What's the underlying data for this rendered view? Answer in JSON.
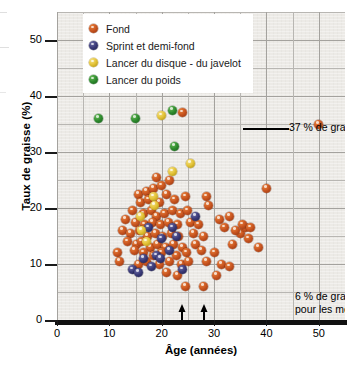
{
  "chart_data": {
    "type": "scatter",
    "title": "",
    "xlabel": "Âge (années)",
    "ylabel": "Taux de graisse (%)",
    "xlim": [
      0,
      55
    ],
    "ylim": [
      0,
      55
    ],
    "xticks": [
      0,
      10,
      20,
      30,
      40,
      50
    ],
    "yticks": [
      0,
      10,
      20,
      30,
      40,
      50
    ],
    "grid": true,
    "grid_step": 5,
    "legend_position": "top-center",
    "series": [
      {
        "name": "Fond",
        "color": "#c8541f",
        "key": "fond",
        "points": [
          [
            24.0,
            37.0
          ],
          [
            50.0,
            35.0
          ],
          [
            40.0,
            23.5
          ],
          [
            19.0,
            25.5
          ],
          [
            21.5,
            25.0
          ],
          [
            24.5,
            22.0
          ],
          [
            15.5,
            22.5
          ],
          [
            17.0,
            23.0
          ],
          [
            18.5,
            23.5
          ],
          [
            20.0,
            24.0
          ],
          [
            16.0,
            21.0
          ],
          [
            17.5,
            21.5
          ],
          [
            19.5,
            21.0
          ],
          [
            21.0,
            22.5
          ],
          [
            22.5,
            21.5
          ],
          [
            14.5,
            19.5
          ],
          [
            16.5,
            19.0
          ],
          [
            18.0,
            19.5
          ],
          [
            19.0,
            18.5
          ],
          [
            20.5,
            19.0
          ],
          [
            22.0,
            19.5
          ],
          [
            23.5,
            19.0
          ],
          [
            25.0,
            19.5
          ],
          [
            13.0,
            18.0
          ],
          [
            15.0,
            17.5
          ],
          [
            16.8,
            17.0
          ],
          [
            18.2,
            17.5
          ],
          [
            19.8,
            17.0
          ],
          [
            21.2,
            17.5
          ],
          [
            23.0,
            17.0
          ],
          [
            25.5,
            17.5
          ],
          [
            27.0,
            17.0
          ],
          [
            12.5,
            16.0
          ],
          [
            14.0,
            15.5
          ],
          [
            15.8,
            16.0
          ],
          [
            17.2,
            15.0
          ],
          [
            18.8,
            15.5
          ],
          [
            20.2,
            15.0
          ],
          [
            21.8,
            15.5
          ],
          [
            23.2,
            15.0
          ],
          [
            26.0,
            15.5
          ],
          [
            28.0,
            15.0
          ],
          [
            13.5,
            14.0
          ],
          [
            15.2,
            13.5
          ],
          [
            16.2,
            14.0
          ],
          [
            17.8,
            13.0
          ],
          [
            19.2,
            13.5
          ],
          [
            20.8,
            13.0
          ],
          [
            22.2,
            13.5
          ],
          [
            24.0,
            13.0
          ],
          [
            26.5,
            13.5
          ],
          [
            11.5,
            12.0
          ],
          [
            14.8,
            12.5
          ],
          [
            16.5,
            12.0
          ],
          [
            18.5,
            11.5
          ],
          [
            20.0,
            12.0
          ],
          [
            22.8,
            11.5
          ],
          [
            24.8,
            12.0
          ],
          [
            27.5,
            12.5
          ],
          [
            30.0,
            12.0
          ],
          [
            12.0,
            10.5
          ],
          [
            15.5,
            10.0
          ],
          [
            17.0,
            10.5
          ],
          [
            19.5,
            10.0
          ],
          [
            21.5,
            10.5
          ],
          [
            23.8,
            10.0
          ],
          [
            25.2,
            10.5
          ],
          [
            28.5,
            10.5
          ],
          [
            31.5,
            10.0
          ],
          [
            33.5,
            13.5
          ],
          [
            35.0,
            15.5
          ],
          [
            36.5,
            14.5
          ],
          [
            36.0,
            16.5
          ],
          [
            34.0,
            16.0
          ],
          [
            32.0,
            16.5
          ],
          [
            33.0,
            18.5
          ],
          [
            35.5,
            17.0
          ],
          [
            37.0,
            16.5
          ],
          [
            38.5,
            13.0
          ],
          [
            21.0,
            8.5
          ],
          [
            23.0,
            8.0
          ],
          [
            30.5,
            8.0
          ],
          [
            33.0,
            9.5
          ],
          [
            24.5,
            6.0
          ],
          [
            28.0,
            6.0
          ],
          [
            29.0,
            20.5
          ],
          [
            31.0,
            18.0
          ],
          [
            28.5,
            22.0
          ]
        ]
      },
      {
        "name": "Sprint et demi-fond",
        "color": "#3a3a78",
        "key": "sprint",
        "points": [
          [
            26.5,
            18.5
          ],
          [
            22.0,
            16.5
          ],
          [
            22.8,
            15.0
          ],
          [
            20.0,
            14.5
          ],
          [
            19.0,
            11.5
          ],
          [
            19.8,
            11.0
          ],
          [
            24.0,
            9.0
          ],
          [
            14.5,
            9.0
          ],
          [
            15.5,
            8.5
          ],
          [
            16.5,
            11.0
          ],
          [
            18.0,
            9.5
          ],
          [
            21.5,
            12.5
          ],
          [
            17.5,
            16.5
          ]
        ]
      },
      {
        "name": "Lancer du disque - du javelot",
        "color": "#e3c235",
        "key": "lancer-disque",
        "points": [
          [
            20.0,
            36.5
          ],
          [
            25.5,
            28.0
          ],
          [
            22.0,
            26.5
          ],
          [
            16.0,
            18.5
          ],
          [
            16.2,
            16.0
          ],
          [
            17.0,
            14.0
          ],
          [
            18.5,
            22.0
          ],
          [
            18.6,
            20.5
          ]
        ]
      },
      {
        "name": "Lancer du poids",
        "color": "#2e8b2e",
        "key": "lancer-poids",
        "points": [
          [
            8.0,
            36.0
          ],
          [
            15.0,
            36.0
          ],
          [
            22.0,
            37.5
          ],
          [
            22.5,
            31.0
          ]
        ]
      }
    ],
    "annotations": [
      {
        "id": "anno-37",
        "text": "37 % de graisse",
        "points_to": [
          24.0,
          37.0
        ],
        "style": "leader-line"
      },
      {
        "id": "anno-6",
        "text_line1": "6 % de graisse",
        "text_line2": "pour les meilleures",
        "points_to": [
          [
            24.5,
            6.0
          ],
          [
            28.0,
            6.0
          ]
        ],
        "style": "double-arrow"
      }
    ]
  },
  "axes": {
    "y": {
      "title": "Taux de graisse (%)",
      "tick_labels": [
        "0",
        "10",
        "20",
        "30",
        "40",
        "50"
      ]
    },
    "x": {
      "title": "Âge (années)",
      "tick_labels": [
        "0",
        "10",
        "20",
        "30",
        "40",
        "50"
      ]
    }
  },
  "legend": {
    "items": [
      {
        "label": "Fond",
        "key": "fond"
      },
      {
        "label": "Sprint et demi-fond",
        "key": "sprint"
      },
      {
        "label": "Lancer du disque - du javelot",
        "key": "lancer-disque"
      },
      {
        "label": "Lancer du poids",
        "key": "lancer-poids"
      }
    ]
  },
  "annotations": {
    "fat_37": "37 % de graisse",
    "fat_6_line1": "6 % de graisse",
    "fat_6_line2": "pour les meilleures"
  },
  "colors": {
    "fond": "#c8541f",
    "sprint": "#3a3a78",
    "lancer_disque": "#e3c235",
    "lancer_poids": "#2e8b2e",
    "plot_background": "#eceae6",
    "gridline": "#b8b6b2",
    "axis": "#111111"
  }
}
